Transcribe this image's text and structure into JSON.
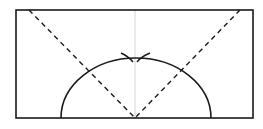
{
  "diagram": {
    "type": "geometric-construction",
    "colors": {
      "background": "#ffffff",
      "stroke": "#1a1a1a",
      "center_line": "#c8c8c8"
    },
    "rectangle": {
      "x": 16,
      "y": 10,
      "width": 237,
      "height": 108
    },
    "center_line": {
      "x": 135,
      "y1": 10,
      "y2": 118
    },
    "dashed_lines": [
      {
        "x1": 29,
        "y1": 10,
        "x2": 135,
        "y2": 118
      },
      {
        "x1": 240,
        "y1": 10,
        "x2": 135,
        "y2": 118
      }
    ],
    "semicircle_arc": {
      "cx": 136,
      "cy": 118,
      "rx": 75,
      "ry": 60
    },
    "compass_marks": [
      {
        "from": [
          121,
          53
        ],
        "ctrl": [
          128,
          56
        ],
        "to": [
          133,
          62
        ]
      },
      {
        "from": [
          150,
          53
        ],
        "ctrl": [
          142,
          56
        ],
        "to": [
          137,
          62
        ]
      }
    ],
    "apex": {
      "x": 135,
      "y": 58
    }
  }
}
